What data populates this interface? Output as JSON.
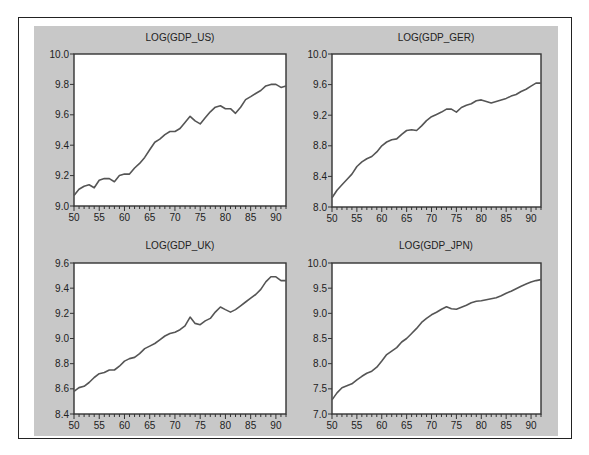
{
  "chart_data": [
    {
      "type": "line",
      "title": "LOG(GDP_US)",
      "xlabel": "",
      "ylabel": "",
      "x": [
        1950,
        1951,
        1952,
        1953,
        1954,
        1955,
        1956,
        1957,
        1958,
        1959,
        1960,
        1961,
        1962,
        1963,
        1964,
        1965,
        1966,
        1967,
        1968,
        1969,
        1970,
        1971,
        1972,
        1973,
        1974,
        1975,
        1976,
        1977,
        1978,
        1979,
        1980,
        1981,
        1982,
        1983,
        1984,
        1985,
        1986,
        1987,
        1988,
        1989,
        1990,
        1991,
        1992
      ],
      "values": [
        9.07,
        9.11,
        9.13,
        9.14,
        9.12,
        9.17,
        9.18,
        9.18,
        9.16,
        9.2,
        9.21,
        9.21,
        9.25,
        9.28,
        9.32,
        9.37,
        9.42,
        9.44,
        9.47,
        9.49,
        9.49,
        9.51,
        9.55,
        9.59,
        9.56,
        9.54,
        9.58,
        9.62,
        9.65,
        9.66,
        9.64,
        9.64,
        9.61,
        9.65,
        9.7,
        9.72,
        9.74,
        9.76,
        9.79,
        9.8,
        9.8,
        9.78,
        9.79
      ],
      "xlim": [
        1950,
        1992
      ],
      "ylim": [
        9.0,
        10.0
      ],
      "xticks": [
        "50",
        "55",
        "60",
        "65",
        "70",
        "75",
        "80",
        "85",
        "90"
      ],
      "yticks": [
        "9.0",
        "9.2",
        "9.4",
        "9.6",
        "9.8",
        "10.0"
      ],
      "grid": false,
      "legend": null
    },
    {
      "type": "line",
      "title": "LOG(GDP_GER)",
      "xlabel": "",
      "ylabel": "",
      "x": [
        1950,
        1951,
        1952,
        1953,
        1954,
        1955,
        1956,
        1957,
        1958,
        1959,
        1960,
        1961,
        1962,
        1963,
        1964,
        1965,
        1966,
        1967,
        1968,
        1969,
        1970,
        1971,
        1972,
        1973,
        1974,
        1975,
        1976,
        1977,
        1978,
        1979,
        1980,
        1981,
        1982,
        1983,
        1984,
        1985,
        1986,
        1987,
        1988,
        1989,
        1990,
        1991,
        1992
      ],
      "values": [
        8.12,
        8.22,
        8.29,
        8.36,
        8.43,
        8.53,
        8.59,
        8.63,
        8.66,
        8.72,
        8.8,
        8.85,
        8.88,
        8.89,
        8.95,
        9.0,
        9.01,
        9.0,
        9.06,
        9.13,
        9.18,
        9.21,
        9.24,
        9.28,
        9.28,
        9.24,
        9.3,
        9.33,
        9.35,
        9.39,
        9.4,
        9.38,
        9.36,
        9.38,
        9.4,
        9.42,
        9.45,
        9.47,
        9.51,
        9.54,
        9.58,
        9.62,
        9.62
      ],
      "xlim": [
        1950,
        1992
      ],
      "ylim": [
        8.0,
        10.0
      ],
      "xticks": [
        "50",
        "55",
        "60",
        "65",
        "70",
        "75",
        "80",
        "85",
        "90"
      ],
      "yticks": [
        "8.0",
        "8.4",
        "8.8",
        "9.2",
        "9.6",
        "10.0"
      ],
      "grid": false,
      "legend": null
    },
    {
      "type": "line",
      "title": "LOG(GDP_UK)",
      "xlabel": "",
      "ylabel": "",
      "x": [
        1950,
        1951,
        1952,
        1953,
        1954,
        1955,
        1956,
        1957,
        1958,
        1959,
        1960,
        1961,
        1962,
        1963,
        1964,
        1965,
        1966,
        1967,
        1968,
        1969,
        1970,
        1971,
        1972,
        1973,
        1974,
        1975,
        1976,
        1977,
        1978,
        1979,
        1980,
        1981,
        1982,
        1983,
        1984,
        1985,
        1986,
        1987,
        1988,
        1989,
        1990,
        1991,
        1992
      ],
      "values": [
        8.58,
        8.61,
        8.62,
        8.65,
        8.69,
        8.72,
        8.73,
        8.75,
        8.75,
        8.78,
        8.82,
        8.84,
        8.85,
        8.88,
        8.92,
        8.94,
        8.96,
        8.99,
        9.02,
        9.04,
        9.05,
        9.07,
        9.1,
        9.17,
        9.12,
        9.11,
        9.14,
        9.16,
        9.21,
        9.25,
        9.23,
        9.21,
        9.23,
        9.26,
        9.29,
        9.32,
        9.35,
        9.39,
        9.45,
        9.49,
        9.49,
        9.46,
        9.46
      ],
      "xlim": [
        1950,
        1992
      ],
      "ylim": [
        8.4,
        9.6
      ],
      "xticks": [
        "50",
        "55",
        "60",
        "65",
        "70",
        "75",
        "80",
        "85",
        "90"
      ],
      "yticks": [
        "8.4",
        "8.6",
        "8.8",
        "9.0",
        "9.2",
        "9.4",
        "9.6"
      ],
      "grid": false,
      "legend": null
    },
    {
      "type": "line",
      "title": "LOG(GDP_JPN)",
      "xlabel": "",
      "ylabel": "",
      "x": [
        1950,
        1951,
        1952,
        1953,
        1954,
        1955,
        1956,
        1957,
        1958,
        1959,
        1960,
        1961,
        1962,
        1963,
        1964,
        1965,
        1966,
        1967,
        1968,
        1969,
        1970,
        1971,
        1972,
        1973,
        1974,
        1975,
        1976,
        1977,
        1978,
        1979,
        1980,
        1981,
        1982,
        1983,
        1984,
        1985,
        1986,
        1987,
        1988,
        1989,
        1990,
        1991,
        1992
      ],
      "values": [
        7.28,
        7.42,
        7.52,
        7.56,
        7.6,
        7.68,
        7.75,
        7.81,
        7.85,
        7.93,
        8.05,
        8.18,
        8.25,
        8.32,
        8.43,
        8.5,
        8.6,
        8.7,
        8.82,
        8.9,
        8.97,
        9.02,
        9.08,
        9.13,
        9.09,
        9.08,
        9.12,
        9.16,
        9.21,
        9.24,
        9.25,
        9.27,
        9.29,
        9.31,
        9.35,
        9.4,
        9.44,
        9.49,
        9.54,
        9.58,
        9.62,
        9.65,
        9.67
      ],
      "xlim": [
        1950,
        1992
      ],
      "ylim": [
        7.0,
        10.0
      ],
      "xticks": [
        "50",
        "55",
        "60",
        "65",
        "70",
        "75",
        "80",
        "85",
        "90"
      ],
      "yticks": [
        "7.0",
        "7.5",
        "8.0",
        "8.5",
        "9.0",
        "9.5",
        "10.0"
      ],
      "grid": false,
      "legend": null
    }
  ],
  "panels": [
    {
      "title": "LOG(GDP_US)"
    },
    {
      "title": "LOG(GDP_GER)"
    },
    {
      "title": "LOG(GDP_UK)"
    },
    {
      "title": "LOG(GDP_JPN)"
    }
  ],
  "colors": {
    "panel_background": "#c8c8c8",
    "plot_background": "#ffffff",
    "line": "#555555",
    "axis": "#333333"
  }
}
